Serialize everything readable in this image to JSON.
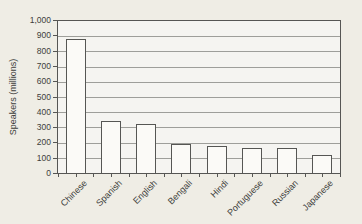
{
  "chart_data": {
    "type": "bar",
    "title": "",
    "xlabel": "",
    "ylabel": "Speakers (millions)",
    "categories": [
      "Chinese",
      "Spanish",
      "English",
      "Bengali",
      "Hindi",
      "Portuguese",
      "Russian",
      "Japanese"
    ],
    "values": [
      880,
      340,
      320,
      190,
      180,
      165,
      165,
      120
    ],
    "ylim": [
      0,
      1000
    ],
    "ytick_step": 100,
    "ytick_labels": [
      "0",
      "100",
      "200",
      "300",
      "400",
      "500",
      "600",
      "700",
      "800",
      "900",
      "1,000"
    ],
    "grid": "horizontal",
    "legend_position": "none"
  },
  "colors": {
    "page_bg": "#efede5",
    "plot_bg": "#f5f4f1",
    "gridline": "#9e9e9a",
    "axis": "#565654",
    "bar_fill": "#fbfaf7",
    "text": "#3d3d3b"
  }
}
